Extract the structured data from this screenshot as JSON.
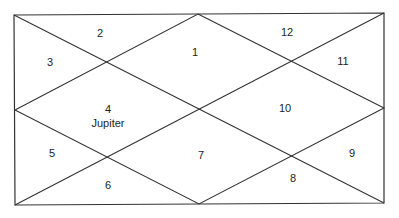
{
  "chart": {
    "title": "",
    "style": "North Indian birth chart",
    "line_color": "#333333",
    "background": "#ffffff",
    "houses": [
      {
        "number": "1",
        "planets": []
      },
      {
        "number": "2",
        "planets": []
      },
      {
        "number": "3",
        "planets": []
      },
      {
        "number": "4",
        "planets": [
          "Jupiter"
        ]
      },
      {
        "number": "5",
        "planets": []
      },
      {
        "number": "6",
        "planets": []
      },
      {
        "number": "7",
        "planets": []
      },
      {
        "number": "8",
        "planets": []
      },
      {
        "number": "9",
        "planets": []
      },
      {
        "number": "10",
        "planets": []
      },
      {
        "number": "11",
        "planets": []
      },
      {
        "number": "12",
        "planets": []
      }
    ]
  }
}
